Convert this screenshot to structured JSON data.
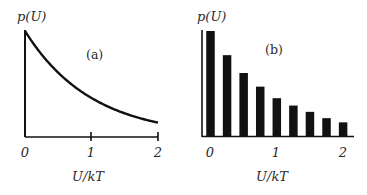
{
  "chart_data": [
    {
      "panel": "(a)",
      "type": "line",
      "title": "",
      "panel_label": "(a)",
      "xlabel": "U/kT",
      "ylabel": "p(U)",
      "xticks": [
        "0",
        "1",
        "2"
      ],
      "xlim": [
        0,
        2
      ],
      "ylim": [
        0,
        1.05
      ],
      "grid": false,
      "legend": null,
      "function": "p(U) ∝ exp(-U/kT)",
      "x": [
        0,
        0.25,
        0.5,
        0.75,
        1.0,
        1.25,
        1.5,
        1.75,
        2.0
      ],
      "values": [
        1.0,
        0.78,
        0.61,
        0.47,
        0.37,
        0.29,
        0.22,
        0.17,
        0.14
      ]
    },
    {
      "panel": "(b)",
      "type": "bar",
      "title": "",
      "panel_label": "(b)",
      "xlabel": "U/kT",
      "ylabel": "p(U)",
      "xticks": [
        "0",
        "1",
        "2"
      ],
      "xlim": [
        0,
        2
      ],
      "ylim": [
        0,
        1.05
      ],
      "grid": false,
      "legend": null,
      "categories": [
        0,
        0.25,
        0.5,
        0.75,
        1.0,
        1.25,
        1.5,
        1.75,
        2.0
      ],
      "values": [
        1.0,
        0.77,
        0.6,
        0.47,
        0.36,
        0.29,
        0.23,
        0.17,
        0.13
      ]
    }
  ],
  "panels": {
    "a": {
      "ylabel": "p(U)",
      "tag": "(a)",
      "ticks": [
        "0",
        "1",
        "2"
      ],
      "xlabel": "U/kT"
    },
    "b": {
      "ylabel": "p(U)",
      "tag": "(b)",
      "ticks": [
        "0",
        "1",
        "2"
      ],
      "xlabel": "U/kT"
    }
  },
  "colors": {
    "ink": "#111111",
    "text": "#2a2a2a",
    "background": "#ffffff"
  }
}
